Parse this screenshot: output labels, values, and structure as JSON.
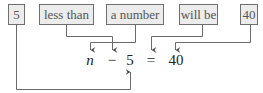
{
  "phrase_boxes": [
    {
      "label": "5",
      "left": 8,
      "width": 17
    },
    {
      "label": "less than",
      "left": 39,
      "width": 55
    },
    {
      "label": "a number",
      "left": 106,
      "width": 58
    },
    {
      "label": "will be",
      "left": 179,
      "width": 39
    },
    {
      "label": "40",
      "left": 240,
      "width": 18
    }
  ],
  "equation": {
    "terms": [
      {
        "symbol": "n",
        "x": 90,
        "italic": true
      },
      {
        "symbol": "−",
        "x": 112
      },
      {
        "symbol": "5",
        "x": 130
      },
      {
        "symbol": "=",
        "x": 151
      },
      {
        "symbol": "40",
        "x": 176
      }
    ]
  },
  "connections": [
    {
      "from": "a number",
      "to": "n"
    },
    {
      "from": "less than",
      "to": "−"
    },
    {
      "from": "5",
      "to": "5"
    },
    {
      "from": "will be",
      "to": "="
    },
    {
      "from": "40",
      "to": "40"
    }
  ],
  "colors": {
    "box_fill": "#ececec",
    "box_border": "#6f6f6f",
    "line": "#6a6a6a",
    "text": "#222222"
  }
}
